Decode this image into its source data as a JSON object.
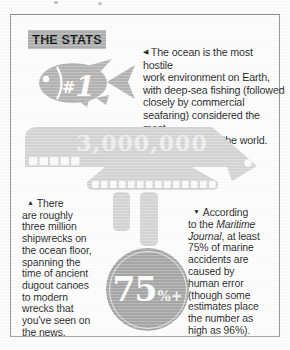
{
  "header": {
    "title": "THE STATS"
  },
  "fish": {
    "hash": "#",
    "number": "1"
  },
  "ship": {
    "value": "3,000,000"
  },
  "intro": {
    "marker": "◀",
    "text": "The ocean is the most hostile\nwork environment on Earth,\nwith deep-sea fishing (followed\nclosely by commercial\nseafaring) considered the most\ndangerous job in the world."
  },
  "shipwrecks": {
    "marker": "▲",
    "text": "There\nare roughly\nthree million\nshipwrecks on\nthe ocean floor,\nspanning the\ntime of ancient\ndugout canoes\nto modern\nwrecks that\nyou've seen on\nthe news."
  },
  "accidents": {
    "marker": "▼",
    "part1": "According\nto the ",
    "journal": "Maritime\nJournal",
    "part2": ", at least\n75% of marine\naccidents are\ncaused by\nhuman error\n(though some\nestimates place\nthe number as\nhigh as 96%)."
  },
  "stat": {
    "value": "75",
    "suffix": "%+"
  },
  "colors": {
    "icon_gray": "#b4b4b4",
    "ship_gray": "#d5d5d5",
    "circle_gray": "#a7a7a7",
    "header_bg": "#afafaf",
    "body_text": "#262626",
    "frame_border": "#8f8f8f"
  }
}
